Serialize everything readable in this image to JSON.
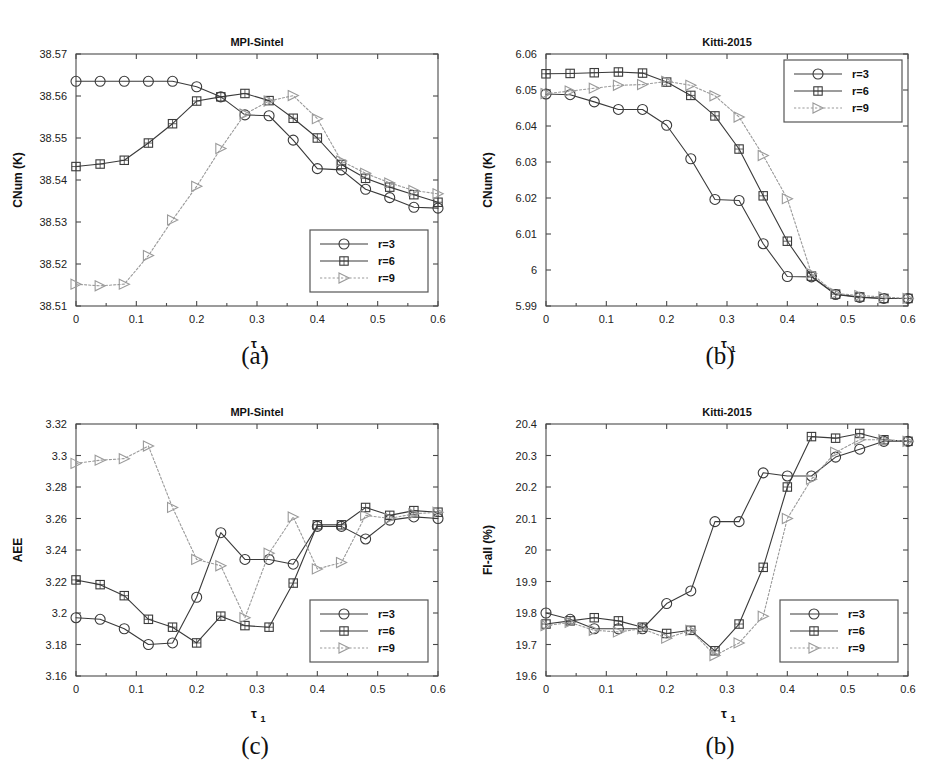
{
  "figure": {
    "subcaptions": {
      "a": "(a)",
      "b": "(b)",
      "c": "(c)",
      "d": "(b)"
    },
    "legend_entries": [
      {
        "label": "r=3",
        "marker": "circle",
        "style": "solid"
      },
      {
        "label": "r=6",
        "marker": "square",
        "style": "solid"
      },
      {
        "label": "r=9",
        "marker": "triangle",
        "style": "dotted"
      }
    ],
    "colors": {
      "line_r3": "#3a3a3a",
      "line_r6": "#3a3a3a",
      "line_r9": "#9a9a9a",
      "frame": "#4a4a4a",
      "text": "#111111",
      "background": "#ffffff"
    },
    "xlabel_main": "τ",
    "xlabel_sub": "1"
  },
  "chart_data": [
    {
      "id": "a",
      "type": "line",
      "title": "MPI-Sintel",
      "xlabel": "τ₁",
      "ylabel": "CNum (K)",
      "xlim": [
        0,
        0.6
      ],
      "ylim": [
        38.51,
        38.57
      ],
      "xticks": [
        0,
        0.1,
        0.2,
        0.3,
        0.4,
        0.5,
        0.6
      ],
      "xticklabels": [
        "0",
        "0.1",
        "0.2",
        "0.3",
        "0.4",
        "0.5",
        "0.6"
      ],
      "yticks": [
        38.51,
        38.52,
        38.53,
        38.54,
        38.55,
        38.56,
        38.57
      ],
      "yticklabels": [
        "38.51",
        "38.52",
        "38.53",
        "38.54",
        "38.55",
        "38.56",
        "38.57"
      ],
      "grid": false,
      "legend_position": "lower-right",
      "x": [
        0,
        0.04,
        0.08,
        0.12,
        0.16,
        0.2,
        0.24,
        0.28,
        0.32,
        0.36,
        0.4,
        0.44,
        0.48,
        0.52,
        0.56,
        0.6
      ],
      "series": [
        {
          "name": "r=3",
          "marker": "circle",
          "style": "solid",
          "values": [
            38.5635,
            38.5635,
            38.5635,
            38.5635,
            38.5635,
            38.5622,
            38.5598,
            38.5555,
            38.5553,
            38.5495,
            38.5427,
            38.5424,
            38.5378,
            38.5358,
            38.5335,
            38.5333
          ]
        },
        {
          "name": "r=6",
          "marker": "square",
          "style": "solid",
          "values": [
            38.5432,
            38.5438,
            38.5447,
            38.5488,
            38.5534,
            38.5588,
            38.5598,
            38.5606,
            38.5589,
            38.5547,
            38.55,
            38.5437,
            38.5404,
            38.5383,
            38.5365,
            38.5347
          ]
        },
        {
          "name": "r=9",
          "marker": "triangle",
          "style": "dotted",
          "values": [
            38.5152,
            38.5148,
            38.5152,
            38.522,
            38.5305,
            38.5385,
            38.5475,
            38.5557,
            38.5588,
            38.5601,
            38.5546,
            38.5445,
            38.5416,
            38.5393,
            38.5375,
            38.5367
          ]
        }
      ]
    },
    {
      "id": "b",
      "type": "line",
      "title": "Kitti-2015",
      "xlabel": "τ₁",
      "ylabel": "CNum (K)",
      "xlim": [
        0,
        0.6
      ],
      "ylim": [
        5.99,
        6.06
      ],
      "xticks": [
        0,
        0.1,
        0.2,
        0.3,
        0.4,
        0.5,
        0.6
      ],
      "xticklabels": [
        "0",
        "0.1",
        "0.2",
        "0.3",
        "0.4",
        "0.5",
        "0.6"
      ],
      "yticks": [
        5.99,
        6.0,
        6.01,
        6.02,
        6.03,
        6.04,
        6.05,
        6.06
      ],
      "yticklabels": [
        "5.99",
        "6",
        "6.01",
        "6.02",
        "6.03",
        "6.04",
        "6.05",
        "6.06"
      ],
      "grid": false,
      "legend_position": "upper-right",
      "x": [
        0,
        0.04,
        0.08,
        0.12,
        0.16,
        0.2,
        0.24,
        0.28,
        0.32,
        0.36,
        0.4,
        0.44,
        0.48,
        0.52,
        0.56,
        0.6
      ],
      "series": [
        {
          "name": "r=3",
          "marker": "circle",
          "style": "solid",
          "values": [
            6.0489,
            6.0487,
            6.0467,
            6.0446,
            6.0446,
            6.0402,
            6.0309,
            6.0196,
            6.0193,
            6.0073,
            5.9982,
            5.9981,
            5.9932,
            5.9924,
            5.9921,
            5.9921
          ]
        },
        {
          "name": "r=6",
          "marker": "square",
          "style": "solid",
          "values": [
            6.0545,
            6.0546,
            6.0548,
            6.055,
            6.0547,
            6.0522,
            6.0485,
            6.0428,
            6.0336,
            6.0206,
            6.008,
            5.9983,
            5.9933,
            5.9925,
            5.9921,
            5.9921
          ]
        },
        {
          "name": "r=9",
          "marker": "triangle",
          "style": "dotted",
          "values": [
            6.049,
            6.0497,
            6.0505,
            6.0513,
            6.0515,
            6.0524,
            6.0513,
            6.0484,
            6.0425,
            6.0318,
            6.0198,
            5.999,
            5.9935,
            5.9929,
            5.9925,
            5.9921
          ]
        }
      ]
    },
    {
      "id": "c",
      "type": "line",
      "title": "MPI-Sintel",
      "xlabel": "τ₁",
      "ylabel": "AEE",
      "xlim": [
        0,
        0.6
      ],
      "ylim": [
        3.16,
        3.32
      ],
      "xticks": [
        0,
        0.1,
        0.2,
        0.3,
        0.4,
        0.5,
        0.6
      ],
      "xticklabels": [
        "0",
        "0.1",
        "0.2",
        "0.3",
        "0.4",
        "0.5",
        "0.6"
      ],
      "yticks": [
        3.16,
        3.18,
        3.2,
        3.22,
        3.24,
        3.26,
        3.28,
        3.3,
        3.32
      ],
      "yticklabels": [
        "3.16",
        "3.18",
        "3.2",
        "3.22",
        "3.24",
        "3.26",
        "3.28",
        "3.3",
        "3.32"
      ],
      "grid": false,
      "legend_position": "lower-right",
      "x": [
        0,
        0.04,
        0.08,
        0.12,
        0.16,
        0.2,
        0.24,
        0.28,
        0.32,
        0.36,
        0.4,
        0.44,
        0.48,
        0.52,
        0.56,
        0.6
      ],
      "series": [
        {
          "name": "r=3",
          "marker": "circle",
          "style": "solid",
          "values": [
            3.197,
            3.196,
            3.19,
            3.18,
            3.181,
            3.21,
            3.251,
            3.234,
            3.234,
            3.231,
            3.255,
            3.255,
            3.247,
            3.259,
            3.261,
            3.26
          ]
        },
        {
          "name": "r=6",
          "marker": "square",
          "style": "solid",
          "values": [
            3.221,
            3.218,
            3.211,
            3.196,
            3.191,
            3.181,
            3.198,
            3.192,
            3.191,
            3.219,
            3.256,
            3.256,
            3.267,
            3.262,
            3.265,
            3.264
          ]
        },
        {
          "name": "r=9",
          "marker": "triangle",
          "style": "dotted",
          "values": [
            3.295,
            3.297,
            3.298,
            3.306,
            3.267,
            3.234,
            3.23,
            3.197,
            3.238,
            3.261,
            3.228,
            3.232,
            3.262,
            3.26,
            3.263,
            3.264
          ]
        }
      ]
    },
    {
      "id": "d",
      "type": "line",
      "title": "Kitti-2015",
      "xlabel": "τ₁",
      "ylabel": "Fl-all (%)",
      "xlim": [
        0,
        0.6
      ],
      "ylim": [
        19.6,
        20.4
      ],
      "xticks": [
        0,
        0.1,
        0.2,
        0.3,
        0.4,
        0.5,
        0.6
      ],
      "xticklabels": [
        "0",
        "0.1",
        "0.2",
        "0.3",
        "0.4",
        "0.5",
        "0.6"
      ],
      "yticks": [
        19.6,
        19.7,
        19.8,
        19.9,
        20.0,
        20.1,
        20.2,
        20.3,
        20.4
      ],
      "yticklabels": [
        "19.6",
        "19.7",
        "19.8",
        "19.9",
        "20",
        "20.1",
        "20.2",
        "20.3",
        "20.4"
      ],
      "grid": false,
      "legend_position": "lower-right",
      "x": [
        0,
        0.04,
        0.08,
        0.12,
        0.16,
        0.2,
        0.24,
        0.28,
        0.32,
        0.36,
        0.4,
        0.44,
        0.48,
        0.52,
        0.56,
        0.6
      ],
      "series": [
        {
          "name": "r=3",
          "marker": "circle",
          "style": "solid",
          "values": [
            19.8,
            19.78,
            19.75,
            19.75,
            19.75,
            19.83,
            19.87,
            20.09,
            20.09,
            20.245,
            20.235,
            20.235,
            20.295,
            20.32,
            20.345,
            20.345
          ]
        },
        {
          "name": "r=6",
          "marker": "square",
          "style": "solid",
          "values": [
            19.765,
            19.775,
            19.785,
            19.775,
            19.755,
            19.735,
            19.745,
            19.68,
            19.765,
            19.945,
            20.2,
            20.36,
            20.355,
            20.37,
            20.35,
            20.345
          ]
        },
        {
          "name": "r=9",
          "marker": "triangle",
          "style": "dotted",
          "values": [
            19.76,
            19.77,
            19.745,
            19.74,
            19.75,
            19.72,
            19.745,
            19.665,
            19.705,
            19.79,
            20.1,
            20.225,
            20.31,
            20.35,
            20.35,
            20.345
          ]
        }
      ]
    }
  ]
}
